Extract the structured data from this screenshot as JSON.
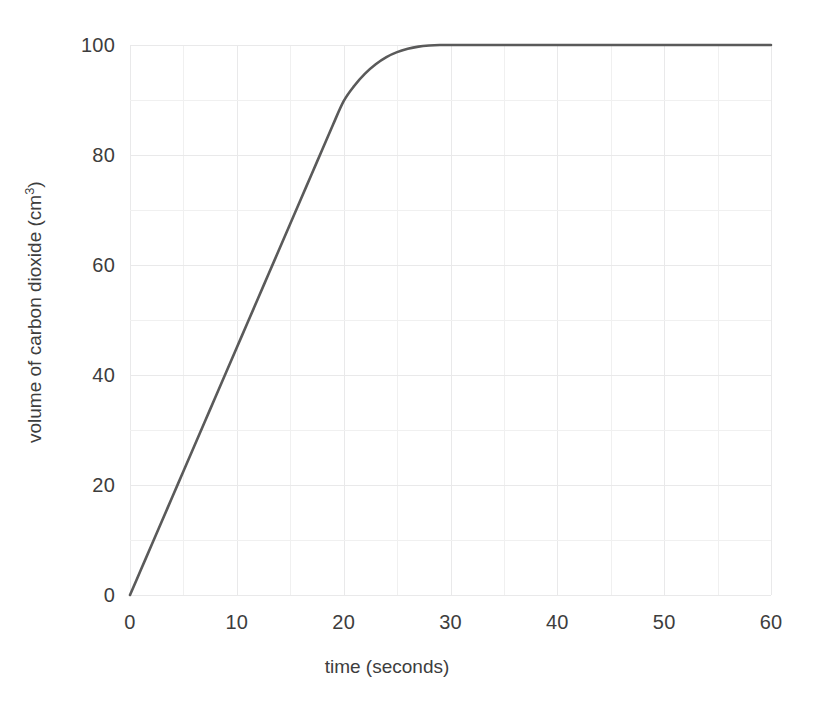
{
  "chart_data": {
    "type": "line",
    "title": "",
    "subtitle": "",
    "xlabel": "time (seconds)",
    "ylabel_text": "volume of carbon dioxide (cm",
    "ylabel_sup": "3",
    "ylabel_tail": ")",
    "ylabel": "volume of carbon dioxide (cm3)",
    "xlim": [
      0,
      60
    ],
    "ylim": [
      0,
      100
    ],
    "xticks": [
      0,
      10,
      20,
      30,
      40,
      50,
      60
    ],
    "xtick_labels": [
      "0",
      "10",
      "20",
      "30",
      "40",
      "50",
      "60"
    ],
    "yticks": [
      0,
      20,
      40,
      60,
      80,
      100
    ],
    "ytick_labels": [
      "0",
      "20",
      "40",
      "60",
      "80",
      "100"
    ],
    "x_minor_step": 5,
    "y_minor_step": 10,
    "grid": true,
    "grid_color": "#eeeeef",
    "legend": "none",
    "line_color": "#5a5a5a",
    "line_width": 2.6,
    "series": [
      {
        "name": "volume of carbon dioxide",
        "x": [
          0,
          1,
          2,
          3,
          4,
          5,
          6,
          7,
          8,
          9,
          10,
          11,
          12,
          13,
          14,
          15,
          16,
          17,
          18,
          19,
          20,
          21,
          22,
          23,
          24,
          25,
          26,
          27,
          28,
          29,
          30,
          32,
          34,
          36,
          38,
          40,
          45,
          50,
          55,
          60
        ],
        "y": [
          0,
          4.5,
          9.0,
          13.5,
          18.0,
          22.5,
          27.0,
          31.5,
          36.0,
          40.5,
          45.0,
          49.5,
          54.0,
          58.5,
          63.0,
          67.5,
          72.0,
          76.5,
          81.0,
          85.5,
          89.8,
          92.6,
          94.8,
          96.5,
          97.8,
          98.7,
          99.3,
          99.7,
          99.9,
          100.0,
          100.0,
          100.0,
          100.0,
          100.0,
          100.0,
          100.0,
          100.0,
          100.0,
          100.0,
          100.0
        ]
      }
    ],
    "annotations": []
  }
}
